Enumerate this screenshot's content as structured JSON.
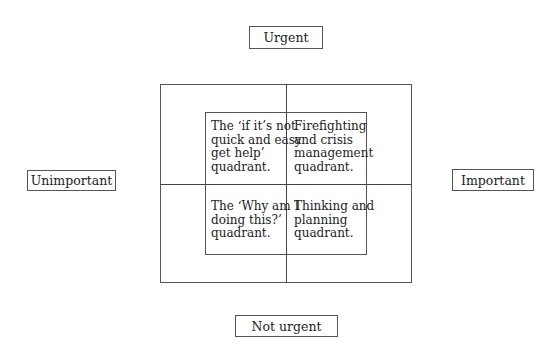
{
  "axes": {
    "top": "Urgent",
    "bottom": "Not urgent",
    "left": "Unimportant",
    "right": "Important"
  },
  "quadrants": {
    "top_left": "The ‘if it’s not\nquick and easy\nget help’\nquadrant.",
    "top_right": "Firefighting\nand crisis\nmanagement\nquadrant.",
    "bottom_left": "The ‘Why am I\ndoing this?’\nquadrant.",
    "bottom_right": "Thinking and\nplanning\nquadrant."
  }
}
